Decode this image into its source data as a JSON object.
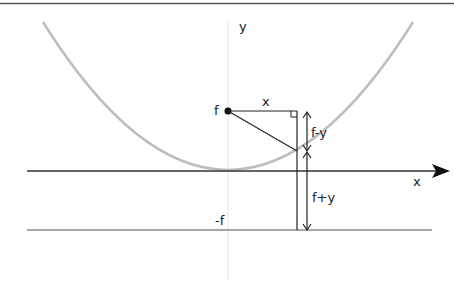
{
  "diagram": {
    "labels": {
      "y_axis": "y",
      "x_axis": "x",
      "focus": "f",
      "horizontal_distance": "x",
      "focus_minus_y": "f-y",
      "focus_plus_y": "f+y",
      "directrix": "-f"
    },
    "colors": {
      "parabola": "#b8b8b8",
      "axis": "#333333",
      "directrix": "#888888",
      "y_axis": "#e4e4e4",
      "top_border": "#555555"
    }
  }
}
